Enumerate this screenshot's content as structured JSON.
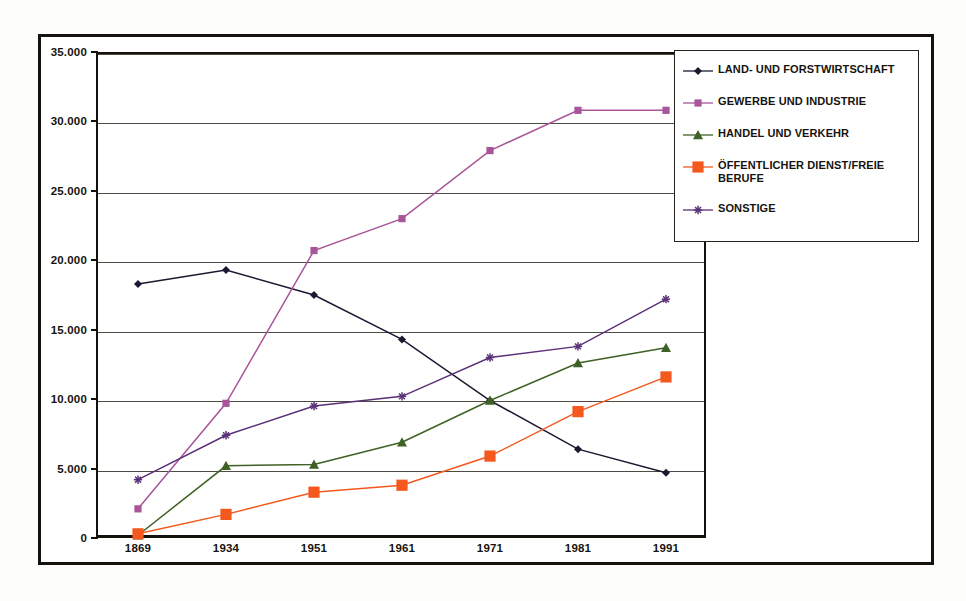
{
  "chart_data": {
    "type": "line",
    "title": "",
    "subtitle": "",
    "xlabel": "",
    "ylabel": "",
    "categories": [
      "1869",
      "1934",
      "1951",
      "1961",
      "1971",
      "1981",
      "1991"
    ],
    "ylim": [
      0,
      35000
    ],
    "ytick_labels": [
      "0",
      "5.000",
      "10.000",
      "15.000",
      "20.000",
      "25.000",
      "30.000",
      "35.000"
    ],
    "ytick_values": [
      0,
      5000,
      10000,
      15000,
      20000,
      25000,
      30000,
      35000
    ],
    "grid": true,
    "legend_position": "right",
    "number_format": "de-DE thousands separator period",
    "series": [
      {
        "name": "LAND- UND FORSTWIRTSCHAFT",
        "color": "#1c1830",
        "marker": "diamond",
        "values": [
          18300,
          19300,
          17500,
          14300,
          9900,
          6400,
          4700
        ]
      },
      {
        "name": "GEWERBE UND INDUSTRIE",
        "color": "#a8559a",
        "marker": "square",
        "values": [
          2100,
          9700,
          20700,
          23000,
          27900,
          30800,
          30800
        ]
      },
      {
        "name": "HANDEL UND VERKEHR",
        "color": "#3f6124",
        "marker": "triangle",
        "values": [
          200,
          5200,
          5300,
          6900,
          9900,
          12600,
          13700
        ]
      },
      {
        "name": "ÖFFENTLICHER DIENST/FREIE BERUFE",
        "color": "#f3581f",
        "marker": "square-large",
        "values": [
          300,
          1700,
          3300,
          3800,
          5900,
          9100,
          11600
        ]
      },
      {
        "name": "SONSTIGE",
        "color": "#5a3178",
        "marker": "asterisk",
        "values": [
          4200,
          7400,
          9500,
          10200,
          13000,
          13800,
          17200
        ]
      }
    ]
  },
  "legend": {
    "entries": [
      {
        "label": "LAND- UND FORSTWIRTSCHAFT"
      },
      {
        "label": "GEWERBE UND INDUSTRIE"
      },
      {
        "label": "HANDEL UND VERKEHR"
      },
      {
        "label": "ÖFFENTLICHER DIENST/FREIE BERUFE"
      },
      {
        "label": "SONSTIGE"
      }
    ]
  },
  "colors": {
    "axis": "#14110d",
    "gridline": "#4e4a44",
    "frame": "#16130f",
    "background": "#ffffff",
    "series_land": "#1c1830",
    "series_gewerbe": "#a8559a",
    "series_handel": "#3f6124",
    "series_oeffentlich": "#f3581f",
    "series_sonstige": "#5a3178"
  }
}
